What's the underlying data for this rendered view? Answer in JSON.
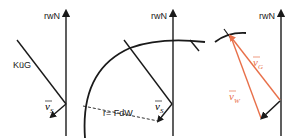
{
  "diagram": {
    "panels": [
      {
        "axis_label": "rwN",
        "line_label": "KüG",
        "vector_label": "v",
        "vector_sub": "S"
      },
      {
        "axis_label": "rwN",
        "radius_label": "r= FdW",
        "vector_label": "v",
        "vector_sub": "S"
      },
      {
        "axis_label": "rwN",
        "vector_g_label": "v",
        "vector_g_sub": "G",
        "vector_w_label": "v",
        "vector_w_sub": "W"
      }
    ],
    "colors": {
      "line": "#1a1a1a",
      "vector_orange": "#e8704a"
    }
  }
}
